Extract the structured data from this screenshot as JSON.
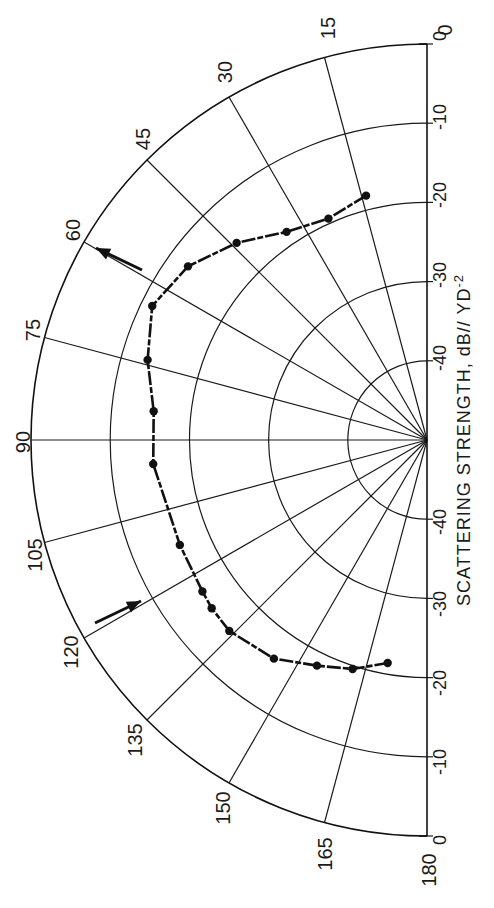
{
  "chart_data": {
    "type": "polar_line",
    "title": "",
    "orientation": "Half-polar plot rotated 90°; 0° at top, 90° at left, 180° at bottom",
    "angular_axis": {
      "label": "Angle (degrees)",
      "range": [
        0,
        180
      ],
      "ticks": [
        0,
        15,
        30,
        45,
        60,
        75,
        90,
        105,
        120,
        135,
        150,
        165,
        180
      ],
      "tick_labels": [
        "0",
        "15",
        "30",
        "45",
        "60",
        "75",
        "90",
        "105",
        "120",
        "135",
        "150",
        "165",
        "180"
      ]
    },
    "radial_axis": {
      "label": "SCATTERING STRENGTH, dB// YD",
      "label_superscript": "-2",
      "range": [
        -50,
        0
      ],
      "rings": [
        0,
        -10,
        -20,
        -30,
        -40
      ],
      "tick_labels_upper": [
        "0",
        "-10",
        "-20",
        "-30",
        "-40"
      ],
      "tick_labels_lower": [
        "-40",
        "-30",
        "-20",
        "-10",
        "0"
      ]
    },
    "grid": true,
    "series": [
      {
        "name": "Scattering strength",
        "marker": "filled-circle",
        "line": "dashed",
        "points": [
          {
            "angle": 14,
            "db": -18.2
          },
          {
            "angle": 24,
            "db": -19.4
          },
          {
            "angle": 34,
            "db": -18.3
          },
          {
            "angle": 44,
            "db": -15.4
          },
          {
            "angle": 54,
            "db": -12.7
          },
          {
            "angle": 64,
            "db": -11.4
          },
          {
            "angle": 74,
            "db": -13.3
          },
          {
            "angle": 84,
            "db": -15.3
          },
          {
            "angle": 95,
            "db": -15.3
          },
          {
            "angle": 113,
            "db": -16.1
          },
          {
            "angle": 124,
            "db": -15.8
          },
          {
            "angle": 128,
            "db": -15.5
          },
          {
            "angle": 134,
            "db": -15.3
          },
          {
            "angle": 145,
            "db": -16.3
          },
          {
            "angle": 154,
            "db": -18.3
          },
          {
            "angle": 162,
            "db": -19.6
          },
          {
            "angle": 170,
            "db": -21.4
          }
        ]
      }
    ],
    "annotations": [
      {
        "type": "arrow",
        "near_angle": 60,
        "direction": "outward-up"
      },
      {
        "type": "arrow",
        "near_angle": 120,
        "direction": "inward-up"
      }
    ]
  },
  "labels": {
    "angle_0": "0",
    "angle_15": "15",
    "angle_30": "30",
    "angle_45": "45",
    "angle_60": "60",
    "angle_75": "75",
    "angle_90": "90",
    "angle_105": "105",
    "angle_120": "120",
    "angle_135": "135",
    "angle_150": "150",
    "angle_165": "165",
    "angle_180": "180",
    "r_up_0": "0",
    "r_up_10": "-10",
    "r_up_20": "-20",
    "r_up_30": "-30",
    "r_up_40": "-40",
    "r_dn_40": "-40",
    "r_dn_30": "-30",
    "r_dn_20": "-20",
    "r_dn_10": "-10",
    "r_dn_0": "0",
    "axis_title": "SCATTERING STRENGTH, dB// YD",
    "axis_title_sup": "-2"
  }
}
